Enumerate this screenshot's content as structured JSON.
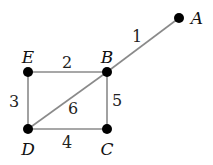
{
  "graph": {
    "nodes": [
      {
        "id": "A",
        "x": 179,
        "y": 18,
        "label": "A",
        "lx": 197,
        "ly": 24
      },
      {
        "id": "B",
        "x": 107,
        "y": 72,
        "label": "B",
        "lx": 107,
        "ly": 63
      },
      {
        "id": "E",
        "x": 28,
        "y": 72,
        "label": "E",
        "lx": 28,
        "ly": 63
      },
      {
        "id": "D",
        "x": 28,
        "y": 129,
        "label": "D",
        "lx": 28,
        "ly": 155
      },
      {
        "id": "C",
        "x": 107,
        "y": 129,
        "label": "C",
        "lx": 107,
        "ly": 155
      }
    ],
    "edges": [
      {
        "from": "B",
        "to": "A",
        "weight": "1",
        "lx": 137,
        "ly": 42
      },
      {
        "from": "E",
        "to": "B",
        "weight": "2",
        "lx": 67,
        "ly": 68
      },
      {
        "from": "E",
        "to": "D",
        "weight": "3",
        "lx": 14,
        "ly": 107
      },
      {
        "from": "D",
        "to": "C",
        "weight": "4",
        "lx": 67,
        "ly": 148
      },
      {
        "from": "B",
        "to": "C",
        "weight": "5",
        "lx": 117,
        "ly": 106
      },
      {
        "from": "D",
        "to": "B",
        "weight": "6",
        "lx": 73,
        "ly": 114
      }
    ]
  }
}
